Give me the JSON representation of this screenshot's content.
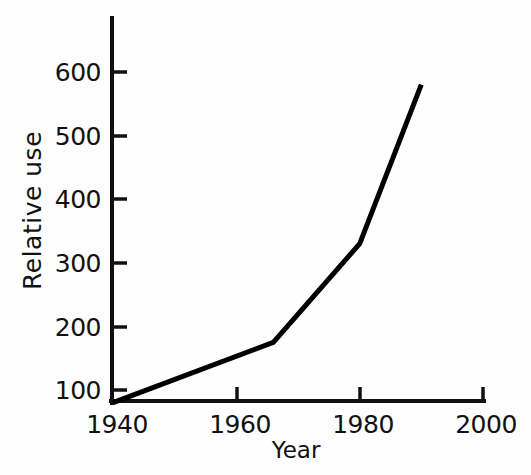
{
  "chart_data": {
    "type": "line",
    "title": "",
    "xlabel": "Year",
    "ylabel": "Relative use",
    "xlim": [
      1940,
      2000
    ],
    "ylim": [
      80,
      665
    ],
    "grid": false,
    "legend": null,
    "x": [
      1940,
      1966,
      1980,
      1990
    ],
    "values": [
      80,
      175,
      330,
      580
    ],
    "series": [
      {
        "name": "Relative use",
        "x": [
          1940,
          1966,
          1980,
          1990
        ],
        "values": [
          80,
          175,
          330,
          580
        ],
        "color": "#000000"
      }
    ],
    "xticks": [
      1940,
      1960,
      1980,
      2000
    ],
    "xtick_labels": [
      "1940",
      "1960",
      "1980",
      "2000"
    ],
    "yticks": [
      100,
      200,
      300,
      400,
      500,
      600
    ],
    "ytick_labels": [
      "100",
      "200",
      "300",
      "400",
      "500",
      "600"
    ]
  },
  "axes": {
    "y_title": "Relative use",
    "x_title": "Year",
    "y_labels": [
      "600",
      "500",
      "400",
      "300",
      "200",
      "100"
    ],
    "x_labels": [
      "1940",
      "1960",
      "1980",
      "2000"
    ],
    "axis_color": "#111111",
    "line_color": "#000000"
  }
}
